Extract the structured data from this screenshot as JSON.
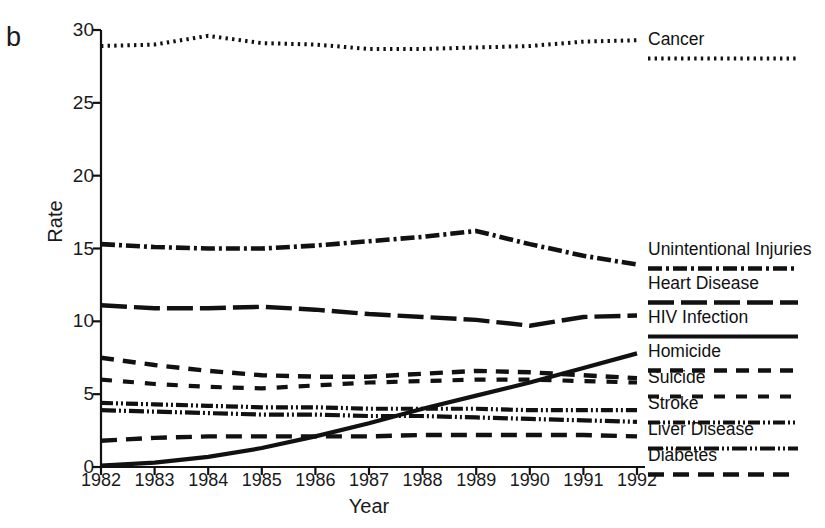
{
  "figure": {
    "panel_label": "b",
    "xlabel": "Year",
    "ylabel": "Rate"
  },
  "chart_data": {
    "type": "line",
    "title": "",
    "xlabel": "Year",
    "ylabel": "Rate",
    "xlim": [
      1982,
      1992
    ],
    "ylim": [
      0,
      30
    ],
    "yticks": [
      0,
      5,
      10,
      15,
      20,
      25,
      30
    ],
    "xticks": [
      1982,
      1983,
      1984,
      1985,
      1986,
      1987,
      1988,
      1989,
      1990,
      1991,
      1992
    ],
    "grid": false,
    "legend_position": "right",
    "x": [
      1982,
      1983,
      1984,
      1985,
      1986,
      1987,
      1988,
      1989,
      1990,
      1991,
      1992
    ],
    "series": [
      {
        "name": "Cancer",
        "style": "dotted",
        "values": [
          28.9,
          29.0,
          29.6,
          29.1,
          29.0,
          28.7,
          28.7,
          28.8,
          28.9,
          29.2,
          29.3
        ]
      },
      {
        "name": "Unintentional Injuries",
        "style": "dash-dot",
        "values": [
          15.3,
          15.1,
          15.0,
          15.0,
          15.2,
          15.5,
          15.8,
          16.2,
          15.3,
          14.5,
          13.9
        ]
      },
      {
        "name": "Heart Disease",
        "style": "long-dash",
        "values": [
          11.1,
          10.9,
          10.9,
          11.0,
          10.8,
          10.5,
          10.3,
          10.1,
          9.7,
          10.3,
          10.4
        ]
      },
      {
        "name": "HIV Infection",
        "style": "solid",
        "values": [
          0.1,
          0.3,
          0.7,
          1.3,
          2.1,
          3.0,
          4.0,
          4.9,
          5.8,
          6.8,
          7.8
        ]
      },
      {
        "name": "Homicide",
        "style": "medium-dash",
        "values": [
          7.5,
          7.0,
          6.6,
          6.3,
          6.2,
          6.2,
          6.4,
          6.6,
          6.5,
          6.3,
          6.1
        ]
      },
      {
        "name": "Suicide",
        "style": "short-dash",
        "values": [
          6.0,
          5.7,
          5.5,
          5.4,
          5.6,
          5.8,
          5.9,
          6.0,
          6.0,
          5.9,
          5.8
        ]
      },
      {
        "name": "Stroke",
        "style": "dash-dot-dot",
        "values": [
          4.4,
          4.3,
          4.2,
          4.1,
          4.1,
          4.0,
          4.0,
          4.0,
          3.9,
          3.9,
          3.9
        ]
      },
      {
        "name": "Liver Disease",
        "style": "dash-dot-dot-tight",
        "values": [
          3.9,
          3.8,
          3.7,
          3.6,
          3.6,
          3.5,
          3.5,
          3.4,
          3.3,
          3.2,
          3.1
        ]
      },
      {
        "name": "Diabetes",
        "style": "dash",
        "values": [
          1.8,
          2.0,
          2.1,
          2.1,
          2.1,
          2.1,
          2.2,
          2.2,
          2.2,
          2.2,
          2.1
        ]
      }
    ]
  },
  "legend": {
    "entries": [
      {
        "label": "Cancer",
        "style": "dotted"
      },
      {
        "label": "Unintentional Injuries",
        "style": "dash-dot"
      },
      {
        "label": "Heart Disease",
        "style": "long-dash"
      },
      {
        "label": "HIV Infection",
        "style": "solid"
      },
      {
        "label": "Homicide",
        "style": "medium-dash"
      },
      {
        "label": "Suicide",
        "style": "short-dash"
      },
      {
        "label": "Stroke",
        "style": "dash-dot-dot"
      },
      {
        "label": "Liver Disease",
        "style": "dash-dot-dot-tight"
      },
      {
        "label": "Diabetes",
        "style": "dash"
      }
    ]
  }
}
